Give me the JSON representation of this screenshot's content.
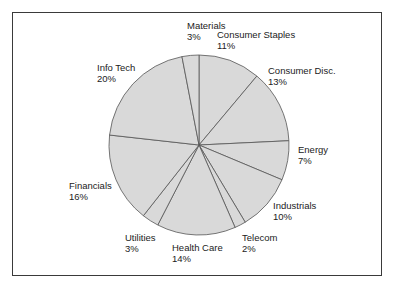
{
  "chart_data": {
    "type": "pie",
    "title": "",
    "start_angle_deg": 0,
    "direction": "clockwise",
    "slice_color": "#d9d9d9",
    "edge_color": "#555555",
    "slices": [
      {
        "label": "Consumer Staples",
        "value": 11,
        "display": "11%"
      },
      {
        "label": "Consumer Disc.",
        "value": 13,
        "display": "13%"
      },
      {
        "label": "Energy",
        "value": 7,
        "display": "7%"
      },
      {
        "label": "Industrials",
        "value": 10,
        "display": "10%"
      },
      {
        "label": "Telecom",
        "value": 2,
        "display": "2%"
      },
      {
        "label": "Health Care",
        "value": 14,
        "display": "14%"
      },
      {
        "label": "Utilities",
        "value": 3,
        "display": "3%"
      },
      {
        "label": "Financials",
        "value": 16,
        "display": "16%"
      },
      {
        "label": "Info Tech",
        "value": 20,
        "display": "20%"
      },
      {
        "label": "Materials",
        "value": 3,
        "display": "3%"
      }
    ],
    "legend": "none"
  }
}
